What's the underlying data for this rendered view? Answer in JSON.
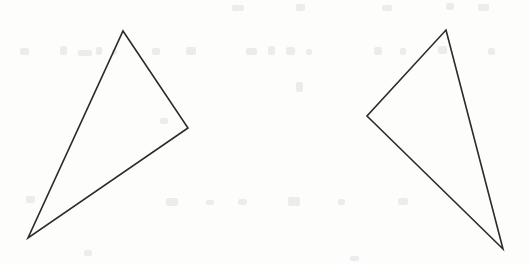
{
  "figure": {
    "width": 530,
    "height": 265,
    "background_color": "#fdfdfc",
    "stroke_color": "#2b2b2b",
    "stroke_width": 1.6,
    "medium": "scanned line drawing",
    "shape_count": 2
  },
  "shapes": [
    {
      "name": "left-triangle",
      "label": "Left triangle",
      "points": "123,31 188,128 28,238",
      "vertices": [
        {
          "name": "apex",
          "x": 123,
          "y": 31
        },
        {
          "name": "right",
          "x": 188,
          "y": 128
        },
        {
          "name": "bottom-left",
          "x": 28,
          "y": 238
        }
      ],
      "orientation": "points down-left"
    },
    {
      "name": "right-triangle",
      "label": "Right triangle",
      "points": "446,30 503,249 367,116",
      "vertices": [
        {
          "name": "apex",
          "x": 446,
          "y": 30
        },
        {
          "name": "bottom-right",
          "x": 503,
          "y": 249
        },
        {
          "name": "left",
          "x": 367,
          "y": 116
        }
      ],
      "orientation": "points down-right"
    }
  ],
  "artifacts": {
    "description": "faint bleed-through ghost marks from reverse side of scanned page",
    "color": "#e9e9ea",
    "marks": [
      {
        "x": 20,
        "y": 48,
        "w": 9,
        "h": 7,
        "r": 2
      },
      {
        "x": 60,
        "y": 46,
        "w": 7,
        "h": 9,
        "r": 2
      },
      {
        "x": 78,
        "y": 50,
        "w": 14,
        "h": 6,
        "r": 2
      },
      {
        "x": 96,
        "y": 47,
        "w": 6,
        "h": 8,
        "r": 2
      },
      {
        "x": 112,
        "y": 49,
        "w": 5,
        "h": 6,
        "r": 2
      },
      {
        "x": 152,
        "y": 48,
        "w": 8,
        "h": 7,
        "r": 2
      },
      {
        "x": 186,
        "y": 47,
        "w": 10,
        "h": 8,
        "r": 2
      },
      {
        "x": 246,
        "y": 48,
        "w": 11,
        "h": 7,
        "r": 2
      },
      {
        "x": 268,
        "y": 46,
        "w": 7,
        "h": 9,
        "r": 2
      },
      {
        "x": 286,
        "y": 47,
        "w": 9,
        "h": 8,
        "r": 2
      },
      {
        "x": 306,
        "y": 49,
        "w": 6,
        "h": 6,
        "r": 2
      },
      {
        "x": 374,
        "y": 47,
        "w": 8,
        "h": 8,
        "r": 2
      },
      {
        "x": 400,
        "y": 48,
        "w": 6,
        "h": 7,
        "r": 2
      },
      {
        "x": 438,
        "y": 46,
        "w": 9,
        "h": 8,
        "r": 2
      },
      {
        "x": 488,
        "y": 48,
        "w": 7,
        "h": 7,
        "r": 2
      },
      {
        "x": 232,
        "y": 5,
        "w": 12,
        "h": 6,
        "r": 2
      },
      {
        "x": 296,
        "y": 4,
        "w": 9,
        "h": 7,
        "r": 2
      },
      {
        "x": 382,
        "y": 5,
        "w": 10,
        "h": 6,
        "r": 2
      },
      {
        "x": 446,
        "y": 3,
        "w": 8,
        "h": 7,
        "r": 2
      },
      {
        "x": 478,
        "y": 4,
        "w": 11,
        "h": 7,
        "r": 2
      },
      {
        "x": 296,
        "y": 82,
        "w": 7,
        "h": 10,
        "r": 2
      },
      {
        "x": 160,
        "y": 118,
        "w": 8,
        "h": 6,
        "r": 2
      },
      {
        "x": 166,
        "y": 198,
        "w": 12,
        "h": 8,
        "r": 2
      },
      {
        "x": 206,
        "y": 200,
        "w": 8,
        "h": 5,
        "r": 2
      },
      {
        "x": 238,
        "y": 199,
        "w": 9,
        "h": 6,
        "r": 2
      },
      {
        "x": 288,
        "y": 197,
        "w": 12,
        "h": 9,
        "r": 2
      },
      {
        "x": 338,
        "y": 199,
        "w": 7,
        "h": 6,
        "r": 2
      },
      {
        "x": 398,
        "y": 198,
        "w": 10,
        "h": 7,
        "r": 2
      },
      {
        "x": 26,
        "y": 196,
        "w": 9,
        "h": 7,
        "r": 2
      },
      {
        "x": 84,
        "y": 250,
        "w": 8,
        "h": 6,
        "r": 2
      },
      {
        "x": 350,
        "y": 256,
        "w": 9,
        "h": 5,
        "r": 2
      }
    ]
  }
}
